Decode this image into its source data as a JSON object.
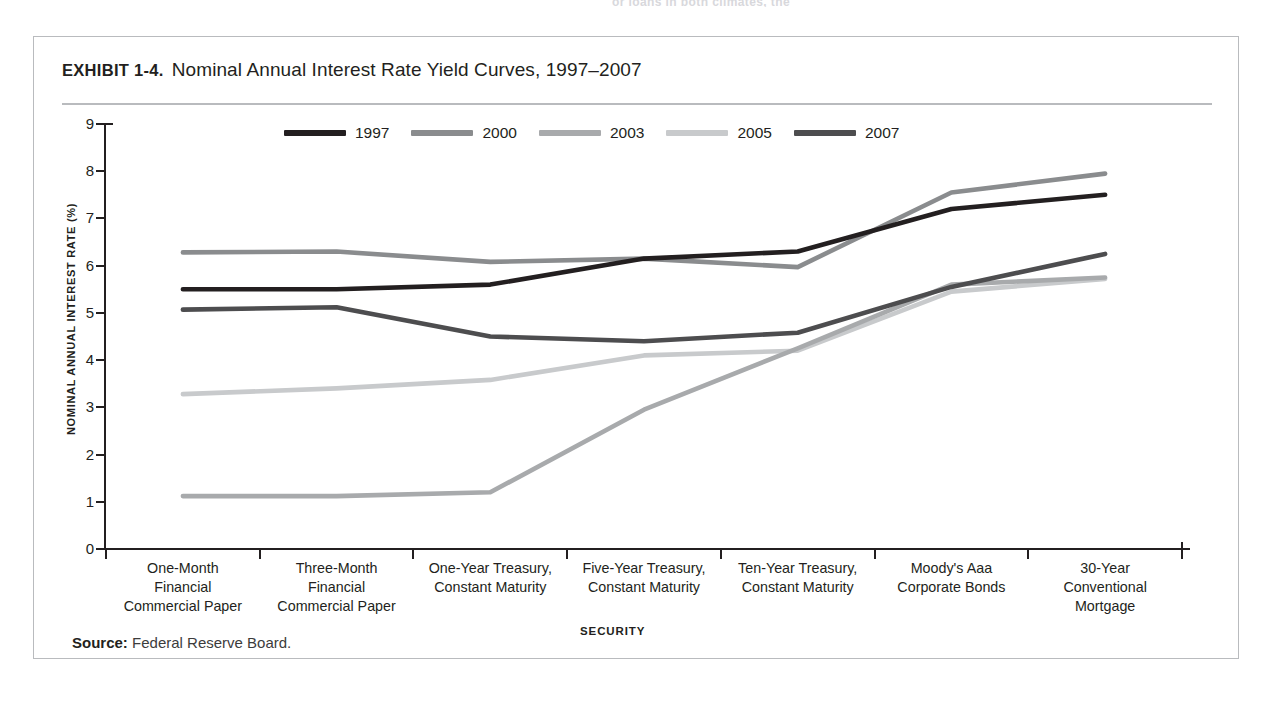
{
  "page": {
    "cutoff_text": "or loans in both climates, the"
  },
  "exhibit": {
    "label": "EXHIBIT 1-4.",
    "title": "Nominal Annual Interest Rate Yield Curves, 1997–2007",
    "source_prefix": "Source:",
    "source_text": "Federal Reserve Board."
  },
  "chart_data": {
    "type": "line",
    "title": "Nominal Annual Interest Rate Yield Curves, 1997–2007",
    "xlabel": "SECURITY",
    "ylabel": "NOMINAL ANNUAL INTEREST RATE (%)",
    "ylim": [
      0,
      9
    ],
    "yticks": [
      0,
      1,
      2,
      3,
      4,
      5,
      6,
      7,
      8,
      9
    ],
    "grid": false,
    "legend_position": "top-center",
    "categories": [
      "One-Month Financial Commercial Paper",
      "Three-Month Financial Commercial Paper",
      "One-Year Treasury, Constant Maturity",
      "Five-Year Treasury, Constant Maturity",
      "Ten-Year Treasury, Constant Maturity",
      "Moody's Aaa Corporate Bonds",
      "30-Year Conventional Mortgage"
    ],
    "category_lines": [
      [
        "One-Month",
        "Financial",
        "Commercial Paper"
      ],
      [
        "Three-Month",
        "Financial",
        "Commercial Paper"
      ],
      [
        "One-Year Treasury,",
        "Constant Maturity"
      ],
      [
        "Five-Year Treasury,",
        "Constant Maturity"
      ],
      [
        "Ten-Year Treasury,",
        "Constant Maturity"
      ],
      [
        "Moody's Aaa",
        "Corporate Bonds"
      ],
      [
        "30-Year",
        "Conventional",
        "Mortgage"
      ]
    ],
    "series": [
      {
        "name": "1997",
        "color": "#231f20",
        "values": [
          5.5,
          5.5,
          5.6,
          6.15,
          6.3,
          7.2,
          7.5
        ]
      },
      {
        "name": "2000",
        "color": "#8a8c8e",
        "values": [
          6.28,
          6.3,
          6.08,
          6.15,
          5.97,
          7.55,
          7.95
        ]
      },
      {
        "name": "2003",
        "color": "#a8aaac",
        "values": [
          1.12,
          1.12,
          1.2,
          2.95,
          4.25,
          5.6,
          5.75
        ]
      },
      {
        "name": "2005",
        "color": "#c8cacc",
        "values": [
          3.28,
          3.4,
          3.58,
          4.1,
          4.2,
          5.45,
          5.72
        ]
      },
      {
        "name": "2007",
        "color": "#4d4d4f",
        "values": [
          5.07,
          5.12,
          4.5,
          4.4,
          4.58,
          5.55,
          6.25
        ]
      }
    ]
  }
}
